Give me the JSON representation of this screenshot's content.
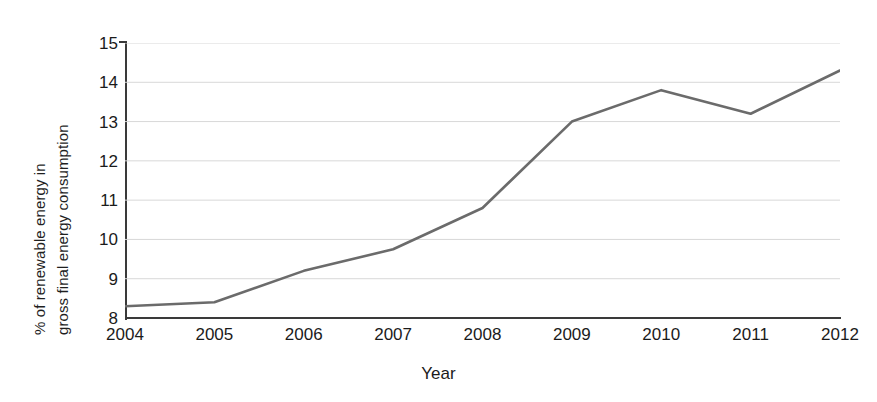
{
  "chart_data": {
    "type": "line",
    "title": "",
    "xlabel": "Year",
    "ylabel": "% of renewable energy in gross final energy consumption",
    "ylabel_lines": [
      "% of renewable energy in",
      "gross final energy consumption"
    ],
    "categories": [
      "2004",
      "2005",
      "2006",
      "2007",
      "2008",
      "2009",
      "2010",
      "2011",
      "2012"
    ],
    "x": [
      2004,
      2005,
      2006,
      2007,
      2008,
      2009,
      2010,
      2011,
      2012
    ],
    "values": [
      8.3,
      8.4,
      9.2,
      9.75,
      10.8,
      13.0,
      13.8,
      13.2,
      14.3
    ],
    "ytick_labels": [
      "15",
      "14",
      "13",
      "12",
      "11",
      "10",
      "9",
      "8"
    ],
    "ytick_values": [
      15,
      14,
      13,
      12,
      11,
      10,
      9,
      8
    ],
    "ylim": [
      8,
      15
    ],
    "xlim": [
      2004,
      2012
    ],
    "grid": "horizontal",
    "legend": "none",
    "series_color": "#6b6b6b",
    "gridline_color": "#d8d8d8",
    "axis_color": "#3a3a3a",
    "background_color": "#ffffff",
    "line_width": 2.6
  }
}
